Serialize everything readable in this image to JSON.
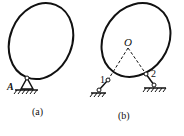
{
  "figure_a": {
    "support_label": "A",
    "caption": "(a)"
  },
  "figure_b": {
    "center_label": "O",
    "point1_label": "1",
    "point2_label": "2",
    "caption": "(b)"
  },
  "colors": {
    "stroke": "#111111",
    "background": "#ffffff"
  }
}
